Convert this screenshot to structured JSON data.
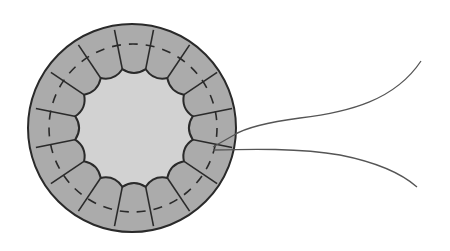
{
  "diagram": {
    "colors": {
      "background": "#ffffff",
      "ring_fill": "#ababab",
      "lumen_fill": "#d2d2d2",
      "outline": "#2a2a2a",
      "thread": "#555555"
    },
    "outer_circle": {
      "cx": 132,
      "cy": 128,
      "r": 104
    },
    "lumen": {
      "cx": 134,
      "cy": 128,
      "r": 60
    },
    "cell_count": 16,
    "dashed_ring_radius": 84,
    "thread": {
      "upper_end": [
        421,
        61
      ],
      "lower_end": [
        417,
        187
      ],
      "entry_point": [
        234,
        135
      ],
      "exit_point": [
        213,
        150
      ]
    }
  }
}
